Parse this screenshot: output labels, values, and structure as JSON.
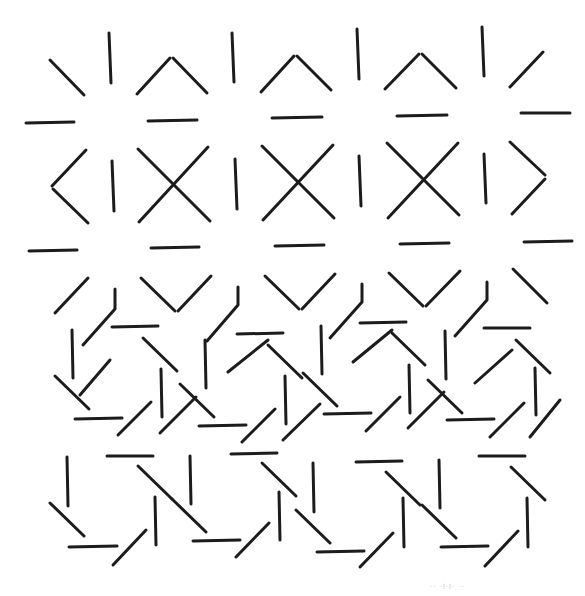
{
  "figure": {
    "title": "",
    "type": "line-segment texture stimulus",
    "background": "#ffffff",
    "stroke_color": "#1c1c1c",
    "stroke_width": 3,
    "sections": [
      {
        "name": "top-star-grid",
        "description": "Upper region: segments radiating around lattice points forming ^, X, <, >, V shapes with vertical and horizontal bars between them",
        "segments": [
          [
            50,
            60,
            84,
            95
          ],
          [
            109,
            33,
            111,
            83
          ],
          [
            137,
            94,
            170,
            58
          ],
          [
            173,
            58,
            207,
            93
          ],
          [
            232,
            33,
            234,
            82
          ],
          [
            261,
            92,
            294,
            56
          ],
          [
            297,
            56,
            331,
            90
          ],
          [
            357,
            29,
            359,
            79
          ],
          [
            385,
            89,
            419,
            54
          ],
          [
            422,
            54,
            456,
            88
          ],
          [
            482,
            27,
            484,
            76
          ],
          [
            510,
            87,
            543,
            52
          ],
          [
            26,
            123,
            74,
            122
          ],
          [
            148,
            121,
            197,
            120
          ],
          [
            272,
            118,
            322,
            117
          ],
          [
            397,
            116,
            447,
            115
          ],
          [
            521,
            113,
            570,
            113
          ],
          [
            86,
            150,
            52,
            186
          ],
          [
            53,
            189,
            88,
            223
          ],
          [
            112,
            161,
            114,
            211
          ],
          [
            138,
            149,
            210,
            221
          ],
          [
            208,
            147,
            139,
            222
          ],
          [
            235,
            159,
            237,
            209
          ],
          [
            262,
            146,
            334,
            218
          ],
          [
            333,
            145,
            263,
            220
          ],
          [
            359,
            156,
            361,
            206
          ],
          [
            387,
            143,
            459,
            215
          ],
          [
            458,
            143,
            388,
            218
          ],
          [
            484,
            154,
            486,
            203
          ],
          [
            510,
            142,
            545,
            175
          ],
          [
            545,
            179,
            512,
            214
          ],
          [
            29,
            251,
            77,
            250
          ],
          [
            151,
            248,
            199,
            247
          ],
          [
            275,
            246,
            324,
            245
          ],
          [
            400,
            244,
            449,
            243
          ],
          [
            524,
            242,
            572,
            241
          ],
          [
            55,
            313,
            88,
            278
          ],
          [
            141,
            278,
            175,
            311
          ],
          [
            178,
            311,
            211,
            276
          ],
          [
            265,
            276,
            299,
            309
          ],
          [
            302,
            309,
            335,
            274
          ],
          [
            389,
            273,
            423,
            306
          ],
          [
            426,
            306,
            460,
            271
          ],
          [
            513,
            269,
            547,
            303
          ]
        ],
        "polylines": [
          [
            [
              115,
              289
            ],
            [
              115,
              309
            ],
            [
              83,
              345
            ]
          ],
          [
            [
              238,
              287
            ],
            [
              238,
              305
            ],
            [
              207,
              341
            ]
          ],
          [
            [
              362,
              284
            ],
            [
              362,
              302
            ],
            [
              330,
              338
            ]
          ],
          [
            [
              487,
              282
            ],
            [
              487,
              300
            ],
            [
              455,
              336
            ]
          ]
        ]
      },
      {
        "name": "bottom-pinwheel-grid",
        "description": "Lower region: staggered tiling of 8-segment pinwheels (rotating octagonal arrangements of bars)",
        "segments": [
          [
            112,
            327,
            158,
            326
          ],
          [
            143,
            338,
            177,
            371
          ],
          [
            72,
            330,
            73,
            378
          ],
          [
            55,
            376,
            89,
            409
          ],
          [
            75,
            419,
            122,
            418
          ],
          [
            118,
            435,
            151,
            402
          ],
          [
            161,
            369,
            162,
            417
          ],
          [
            237,
            334,
            283,
            333
          ],
          [
            268,
            345,
            302,
            378
          ],
          [
            205,
            340,
            206,
            388
          ],
          [
            180,
            384,
            214,
            417
          ],
          [
            199,
            426,
            246,
            425
          ],
          [
            242,
            442,
            275,
            409
          ],
          [
            285,
            376,
            286,
            424
          ],
          [
            360,
            323,
            406,
            322
          ],
          [
            392,
            333,
            425,
            365
          ],
          [
            321,
            326,
            322,
            374
          ],
          [
            303,
            373,
            337,
            406
          ],
          [
            324,
            414,
            371,
            413
          ],
          [
            366,
            431,
            400,
            397
          ],
          [
            409,
            365,
            410,
            413
          ],
          [
            484,
            328,
            530,
            328
          ],
          [
            516,
            340,
            550,
            373
          ],
          [
            445,
            331,
            446,
            379
          ],
          [
            428,
            380,
            462,
            413
          ],
          [
            447,
            420,
            494,
            419
          ],
          [
            490,
            437,
            524,
            403
          ],
          [
            535,
            368,
            536,
            415
          ],
          [
            107,
            456,
            153,
            456
          ],
          [
            138,
            466,
            172,
            499
          ],
          [
            67,
            457,
            68,
            506
          ],
          [
            50,
            503,
            84,
            536
          ],
          [
            69,
            547,
            117,
            546
          ],
          [
            113,
            565,
            146,
            530
          ],
          [
            155,
            497,
            156,
            545
          ],
          [
            231,
            454,
            277,
            453
          ],
          [
            262,
            463,
            296,
            496
          ],
          [
            190,
            456,
            191,
            504
          ],
          [
            172,
            499,
            206,
            532
          ],
          [
            193,
            541,
            240,
            540
          ],
          [
            236,
            557,
            269,
            523
          ],
          [
            279,
            492,
            280,
            540
          ],
          [
            356,
            462,
            402,
            461
          ],
          [
            386,
            472,
            420,
            505
          ],
          [
            313,
            463,
            314,
            512
          ],
          [
            296,
            510,
            330,
            543
          ],
          [
            317,
            552,
            364,
            551
          ],
          [
            360,
            567,
            393,
            533
          ],
          [
            403,
            498,
            404,
            547
          ],
          [
            479,
            456,
            525,
            456
          ],
          [
            511,
            467,
            545,
            500
          ],
          [
            439,
            460,
            440,
            508
          ],
          [
            422,
            505,
            456,
            538
          ],
          [
            441,
            547,
            488,
            546
          ],
          [
            485,
            566,
            518,
            531
          ],
          [
            527,
            498,
            528,
            547
          ],
          [
            80,
            395,
            110,
            360
          ],
          [
            228,
            372,
            268,
            340
          ],
          [
            353,
            362,
            392,
            330
          ],
          [
            475,
            383,
            512,
            350
          ],
          [
            160,
            433,
            196,
            397
          ],
          [
            283,
            440,
            320,
            404
          ],
          [
            408,
            428,
            444,
            392
          ],
          [
            530,
            437,
            560,
            400
          ]
        ],
        "polylines": []
      }
    ],
    "caption": "·· ·l·l· ··"
  }
}
